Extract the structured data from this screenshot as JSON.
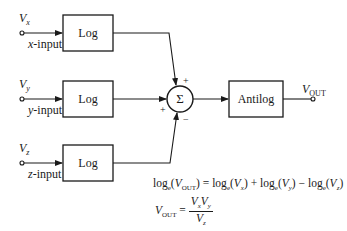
{
  "inputs": [
    {
      "symbol": "V",
      "subscript": "x",
      "label_var": "x",
      "label_suffix": "-input",
      "block": "Log"
    },
    {
      "symbol": "V",
      "subscript": "y",
      "label_var": "y",
      "label_suffix": "-input",
      "block": "Log"
    },
    {
      "symbol": "V",
      "subscript": "z",
      "label_var": "z",
      "label_suffix": "-input",
      "block": "Log"
    }
  ],
  "summer": {
    "symbol": "Σ",
    "signs": {
      "top": "+",
      "left": "+",
      "bottom": "−"
    }
  },
  "output_block": "Antilog",
  "output": {
    "symbol": "V",
    "subscript": "OUT"
  },
  "equations": {
    "eq1": {
      "lhs_log": "log",
      "lhs_base": "e",
      "lhs_open": "(",
      "lhs_var": "V",
      "lhs_sub": "OUT",
      "lhs_close": ")",
      "equals": " = ",
      "term1_log": "log",
      "term1_base": "e",
      "term1_var": "V",
      "term1_sub": "x",
      "plus": " + ",
      "term2_log": "log",
      "term2_base": "e",
      "term2_var": "V",
      "term2_sub": "y",
      "minus": " − ",
      "term3_log": "log",
      "term3_base": "e",
      "term3_var": "V",
      "term3_sub": "z"
    },
    "eq2": {
      "lhs_var": "V",
      "lhs_sub": "OUT",
      "equals": " = ",
      "num1_var": "V",
      "num1_sub": "x",
      "num2_var": "V",
      "num2_sub": "y",
      "den_var": "V",
      "den_sub": "z"
    }
  }
}
